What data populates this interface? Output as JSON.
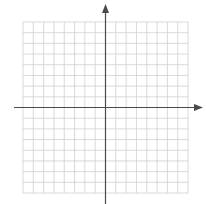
{
  "diagram": {
    "type": "coordinate-plane",
    "grid": {
      "columns": 16,
      "rows": 16,
      "left": 23,
      "top": 22,
      "right": 188,
      "bottom": 193,
      "line_color": "#cfcfcf",
      "line_width": 0.8
    },
    "axes": {
      "color": "#4a4a4a",
      "width": 1.2,
      "origin": {
        "x": 105.5,
        "y": 107.5
      },
      "x_axis": {
        "start": 14,
        "end": 203,
        "arrow": "right"
      },
      "y_axis": {
        "start": 4,
        "end": 204,
        "arrow": "up"
      }
    },
    "quadrants": {
      "cells_left_of_y_axis": 8,
      "cells_right_of_y_axis": 8,
      "cells_above_x_axis": 8,
      "cells_below_x_axis": 8
    }
  }
}
